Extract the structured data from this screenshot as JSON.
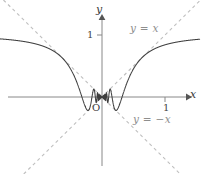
{
  "figure": {
    "name": "graph-x-sin-one-over-x",
    "background_color": "#ffffff",
    "axes": {
      "x_axis_label": "x",
      "y_axis_label": "y",
      "origin_label": "O",
      "x_tick_label": "1",
      "y_tick_label": "1",
      "x_tick_value": 1,
      "y_tick_value": 1,
      "axis_color": "#888888",
      "origin_px": {
        "x": 102,
        "y": 97
      },
      "unit_px": {
        "x": 63,
        "y": 62
      },
      "x_range": [
        -1.62,
        1.55
      ],
      "y_range": [
        -1.24,
        1.55
      ],
      "grid": false
    },
    "annotations": [
      {
        "id": "y-equals-x",
        "text": "y = x",
        "color": "#8e8e8e"
      },
      {
        "id": "y-equals-neg-x",
        "text": "y = −x",
        "color": "#8e8e8e"
      }
    ]
  },
  "chart_data": {
    "type": "line",
    "title": "",
    "subtitle": "",
    "xlabel": "x",
    "ylabel": "y",
    "xlim": [
      -1.62,
      1.55
    ],
    "ylim": [
      -1.24,
      1.55
    ],
    "grid": false,
    "legend_position": "inline-annotation",
    "series": [
      {
        "name": "y = x sin(1/x)",
        "style": "solid",
        "color": "#3f3f3f",
        "function": "x*sin(1/x)",
        "samples_note": "dense sampling; oscillation compresses toward x = 0, amplitude bounded by |x|",
        "key_points": [
          {
            "x": -1.6,
            "y": 0.97
          },
          {
            "x": -1.2,
            "y": 0.93
          },
          {
            "x": -1.0,
            "y": 0.84
          },
          {
            "x": -0.8,
            "y": 0.79
          },
          {
            "x": -0.6,
            "y": 0.6
          },
          {
            "x": -0.5,
            "y": 0.45
          },
          {
            "x": -0.4,
            "y": 0.23
          },
          {
            "x": -0.3183,
            "y": 0.0
          },
          {
            "x": -0.25,
            "y": -0.19
          },
          {
            "x": -0.2122,
            "y": -0.21
          },
          {
            "x": -0.1592,
            "y": 0.0
          },
          {
            "x": -0.1273,
            "y": 0.12
          },
          {
            "x": -0.1061,
            "y": 0.0
          },
          {
            "x": 0.0,
            "y": 0.0
          },
          {
            "x": 0.1061,
            "y": 0.0
          },
          {
            "x": 0.1273,
            "y": 0.12
          },
          {
            "x": 0.1592,
            "y": 0.0
          },
          {
            "x": 0.2122,
            "y": -0.21
          },
          {
            "x": 0.25,
            "y": -0.19
          },
          {
            "x": 0.3183,
            "y": 0.0
          },
          {
            "x": 0.4,
            "y": 0.23
          },
          {
            "x": 0.5,
            "y": 0.45
          },
          {
            "x": 0.6,
            "y": 0.6
          },
          {
            "x": 0.8,
            "y": 0.79
          },
          {
            "x": 1.0,
            "y": 0.84
          },
          {
            "x": 1.2,
            "y": 0.93
          },
          {
            "x": 1.55,
            "y": 0.97
          }
        ]
      },
      {
        "name": "y = x",
        "style": "dashed",
        "color": "#bfbfbf",
        "function": "x",
        "label": "y = x"
      },
      {
        "name": "y = -x",
        "style": "dashed",
        "color": "#bfbfbf",
        "function": "-x",
        "label": "y = −x"
      }
    ]
  }
}
